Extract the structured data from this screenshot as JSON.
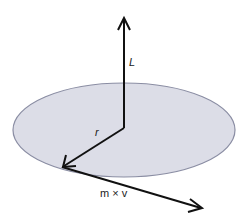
{
  "diagram": {
    "colors": {
      "disk_fill": "#dcdde7",
      "disk_stroke": "#8a8da3",
      "arrow": "#111111",
      "label": "#222222"
    },
    "labels": {
      "angular_momentum": "L",
      "position": "r",
      "momentum": "m × v"
    },
    "elements": [
      {
        "id": "disk",
        "type": "ellipse",
        "cx": 124,
        "cy": 130,
        "rx": 111,
        "ry": 47
      },
      {
        "id": "L-vector",
        "from": [
          124,
          128
        ],
        "to": [
          124,
          18
        ],
        "label": "L"
      },
      {
        "id": "r-vector",
        "from": [
          124,
          128
        ],
        "to": [
          63,
          167
        ],
        "label": "r"
      },
      {
        "id": "mv-vector",
        "from": [
          63,
          167
        ],
        "to": [
          202,
          208
        ],
        "label": "m × v"
      }
    ]
  }
}
